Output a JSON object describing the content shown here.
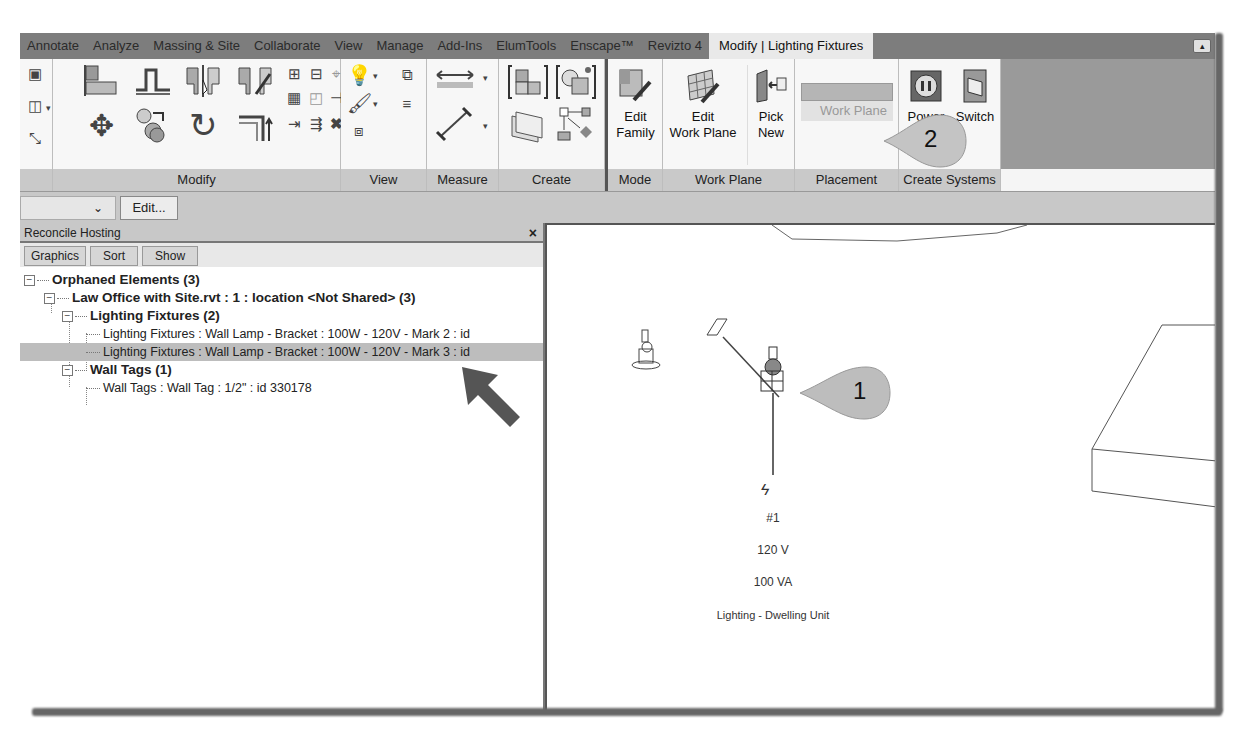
{
  "ribbon": {
    "tabs": [
      {
        "label": "Annotate"
      },
      {
        "label": "Analyze"
      },
      {
        "label": "Massing & Site"
      },
      {
        "label": "Collaborate"
      },
      {
        "label": "View"
      },
      {
        "label": "Manage"
      },
      {
        "label": "Add-Ins"
      },
      {
        "label": "ElumTools"
      },
      {
        "label": "Enscape™"
      },
      {
        "label": "Revizto 4"
      },
      {
        "label": "Modify | Lighting Fixtures",
        "active": true
      }
    ],
    "panels": {
      "modify": {
        "title": "Modify"
      },
      "view": {
        "title": "View"
      },
      "measure": {
        "title": "Measure"
      },
      "create": {
        "title": "Create"
      },
      "mode": {
        "title": "Mode",
        "buttons": [
          {
            "line1": "Edit",
            "line2": "Family"
          }
        ]
      },
      "work_plane": {
        "title": "Work Plane",
        "buttons": [
          {
            "line1": "Edit",
            "line2": "Work Plane"
          },
          {
            "line1": "Pick",
            "line2": "New"
          }
        ]
      },
      "placement": {
        "title": "Placement",
        "disabled_label": "Work Plane"
      },
      "create_systems": {
        "title": "Create Systems",
        "buttons": [
          {
            "label": "Power"
          },
          {
            "label": "Switch"
          }
        ]
      }
    }
  },
  "options_bar": {
    "type_select_value": "",
    "edit_button": "Edit..."
  },
  "reconcile_hosting": {
    "title": "Reconcile Hosting",
    "close": "×",
    "toolbar": [
      "Graphics",
      "Sort",
      "Show"
    ],
    "tree": {
      "root": "Orphaned Elements (3)",
      "file": "Law Office with Site.rvt : 1 : location <Not Shared> (3)",
      "lighting_group": "Lighting Fixtures (2)",
      "lighting_items": [
        "Lighting Fixtures : Wall Lamp - Bracket : 100W - 120V - Mark 2 : id",
        "Lighting Fixtures : Wall Lamp - Bracket : 100W - 120V - Mark 3 : id"
      ],
      "walltag_group": "Wall Tags (1)",
      "walltag_items": [
        "Wall Tags : Wall Tag : 1/2\" : id 330178"
      ]
    }
  },
  "canvas": {
    "circuit_tag": {
      "number": "#1",
      "voltage": "120 V",
      "load": "100 VA",
      "load_class": "Lighting - Dwelling Unit"
    }
  },
  "callouts": [
    {
      "number": "1"
    },
    {
      "number": "2"
    }
  ]
}
